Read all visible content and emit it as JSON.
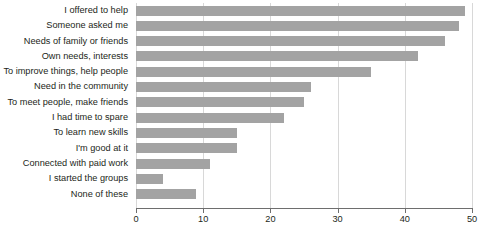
{
  "chart_data": {
    "type": "bar",
    "orientation": "horizontal",
    "title": "",
    "subtitle": "",
    "xlabel": "",
    "ylabel": "",
    "xlim": [
      0,
      50
    ],
    "xticks": [
      0,
      10,
      20,
      30,
      40,
      50
    ],
    "xtick_labels": [
      "0",
      "10",
      "20",
      "30",
      "40",
      "50"
    ],
    "grid": "vertical",
    "legend": "none",
    "bar_color": "#a3a3a3",
    "axis_color": "#6e6e6e",
    "gridline_color": "#d8d8d8",
    "text_color": "#231f20",
    "categories": [
      "I offered to help",
      "Someone asked me",
      "Needs of family or friends",
      "Own needs, interests",
      "To improve things, help people",
      "Need in the community",
      "To meet people, make friends",
      "I had time to spare",
      "To learn new skills",
      "I'm good at it",
      "Connected with paid work",
      "I started the groups",
      "None of these"
    ],
    "values": [
      49,
      48,
      46,
      42,
      35,
      26,
      25,
      22,
      15,
      15,
      11,
      4,
      9
    ]
  }
}
